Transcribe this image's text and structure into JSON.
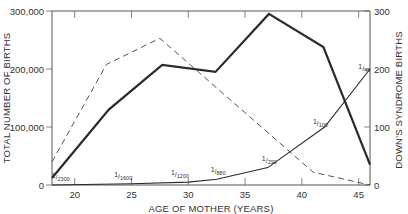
{
  "chart_data": {
    "type": "line",
    "title": "",
    "xlabel": "AGE OF MOTHER (YEARS)",
    "ylabel_left": "TOTAL NUMBER OF BIRTHS",
    "ylabel_right": "DOWN'S SYNDROME BIRTHS",
    "xlim": [
      18,
      46
    ],
    "ylim_left": [
      0,
      300000
    ],
    "ylim_right": [
      0,
      300
    ],
    "x_ticks": [
      20,
      25,
      30,
      35,
      40,
      45
    ],
    "x_tick_labels": [
      "20",
      "25",
      "30",
      "35",
      "40",
      "45"
    ],
    "y_left_ticks": [
      0,
      100000,
      200000,
      300000
    ],
    "y_left_tick_labels": [
      "0",
      "100,000",
      "200,000",
      "300,000"
    ],
    "y_right_ticks": [
      0,
      100,
      200,
      300
    ],
    "y_right_tick_labels": [
      "0",
      "100",
      "200",
      "300"
    ],
    "grid": false,
    "legend": null,
    "series": [
      {
        "name": "Total number of births",
        "axis": "left",
        "style": "dashed",
        "x": [
          18,
          22.8,
          27.5,
          41,
          46
        ],
        "values": [
          40000,
          208000,
          253000,
          22000,
          0
        ]
      },
      {
        "name": "Down's syndrome births",
        "axis": "right",
        "style": "solid-heavy",
        "x": [
          18,
          23,
          27.7,
          32.4,
          37.1,
          41.9,
          46
        ],
        "values": [
          12,
          130,
          207,
          195,
          295,
          238,
          35
        ]
      },
      {
        "name": "Incidence of Down's syndrome",
        "axis": "right",
        "style": "solid-thin",
        "x": [
          18,
          25,
          30,
          32.5,
          37,
          42,
          46
        ],
        "values": [
          0,
          2,
          5,
          10,
          30,
          100,
          200
        ],
        "annotations": [
          {
            "label_num": "1",
            "label_den": "2300",
            "x": 18.5
          },
          {
            "label_num": "1",
            "label_den": "1600",
            "x": 24
          },
          {
            "label_num": "1",
            "label_den": "1200",
            "x": 29
          },
          {
            "label_num": "1",
            "label_den": "880",
            "x": 32.5
          },
          {
            "label_num": "1",
            "label_den": "290",
            "x": 37
          },
          {
            "label_num": "1",
            "label_den": "100",
            "x": 41.5
          },
          {
            "label_num": "1",
            "label_den": "46",
            "x": 45.5
          }
        ]
      }
    ]
  }
}
